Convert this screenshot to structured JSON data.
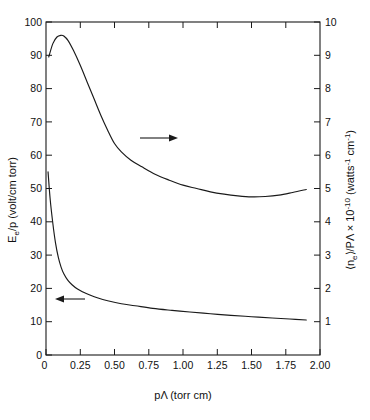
{
  "chart_data": {
    "type": "line",
    "title": "",
    "xlabel": "pΛ (torr cm)",
    "ylabel": "E_e/p (volt/cm torr)",
    "y2label": "⟨n_e⟩/PΛ × 10⁻¹⁰ (watts⁻¹ cm⁻¹)",
    "xlim": [
      0,
      2.0
    ],
    "ylim": [
      0,
      100
    ],
    "y2lim": [
      0,
      10
    ],
    "grid": false,
    "legend": null,
    "xticks": [
      0,
      0.25,
      0.5,
      0.75,
      1.0,
      1.25,
      1.5,
      1.75,
      2.0
    ],
    "xticklabels": [
      "0",
      "0.25",
      "0.50",
      "0.75",
      "1.00",
      "1.25",
      "1.50",
      "1.75",
      "2.00"
    ],
    "yticks": [
      0,
      10,
      20,
      30,
      40,
      50,
      60,
      70,
      80,
      90,
      100
    ],
    "yticklabels": [
      "0",
      "10",
      "20",
      "30",
      "40",
      "50",
      "60",
      "70",
      "80",
      "90",
      "100"
    ],
    "y2ticks": [
      1,
      2,
      3,
      4,
      5,
      6,
      7,
      8,
      9,
      10
    ],
    "y2ticklabels": [
      "1",
      "2",
      "3",
      "4",
      "5",
      "6",
      "7",
      "8",
      "9",
      "10"
    ],
    "series": [
      {
        "name": "E_e/p",
        "axis": "left",
        "annotation": "left-arrow",
        "x": [
          0.015,
          0.03,
          0.05,
          0.07,
          0.09,
          0.11,
          0.13,
          0.16,
          0.19,
          0.23,
          0.27,
          0.32,
          0.38,
          0.45,
          0.55,
          0.65,
          0.78,
          0.92,
          1.05,
          1.2,
          1.35,
          1.5,
          1.65,
          1.78,
          1.9
        ],
        "y": [
          55.0,
          47.0,
          39.5,
          33.5,
          29.3,
          26.4,
          24.4,
          22.4,
          21.1,
          19.8,
          18.9,
          18.0,
          17.1,
          16.3,
          15.4,
          14.8,
          14.0,
          13.4,
          12.9,
          12.4,
          11.9,
          11.5,
          11.1,
          10.8,
          10.5
        ]
      },
      {
        "name": "<n_e>/PL",
        "axis": "right",
        "annotation": "right-arrow",
        "x": [
          0.02,
          0.05,
          0.08,
          0.11,
          0.13,
          0.16,
          0.2,
          0.25,
          0.3,
          0.35,
          0.4,
          0.45,
          0.5,
          0.55,
          0.62,
          0.7,
          0.8,
          0.9,
          1.0,
          1.1,
          1.2,
          1.3,
          1.4,
          1.5,
          1.6,
          1.7,
          1.8,
          1.9
        ],
        "y": [
          8.95,
          9.35,
          9.55,
          9.6,
          9.58,
          9.45,
          9.15,
          8.7,
          8.2,
          7.7,
          7.2,
          6.75,
          6.35,
          6.1,
          5.85,
          5.65,
          5.42,
          5.25,
          5.1,
          5.0,
          4.9,
          4.83,
          4.78,
          4.75,
          4.76,
          4.8,
          4.88,
          4.97
        ]
      }
    ],
    "annotations": [
      {
        "name": "right-arrow",
        "label": "→",
        "x_px": 140,
        "y_px": 138,
        "points_to": "right-axis-curve"
      },
      {
        "name": "left-arrow",
        "label": "←",
        "x_px": 85,
        "y_px": 299,
        "points_to": "left-axis-curve"
      }
    ]
  },
  "axes": {
    "left_title_parts": {
      "main1": "E",
      "sub": "e",
      "main2": "/p  (volt/cm torr)"
    },
    "right_title_parts": {
      "p1": "⟨n",
      "sub1": "e",
      "p2": "⟩/PΛ × 10",
      "sup1": "-10",
      "p3": " (watts",
      "sup2": "-1",
      "p4": " cm",
      "sup3": "-1",
      "p5": ")"
    },
    "bottom_title_parts": {
      "p1": "pΛ  (torr cm)"
    }
  },
  "colors": {
    "ink": "#1a1a1a",
    "background": "#ffffff"
  }
}
